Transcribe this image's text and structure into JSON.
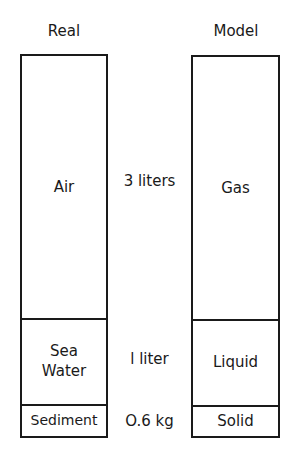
{
  "columns": {
    "real": {
      "title": "Real",
      "layers": [
        "Air",
        "Sea\nWater",
        "Sediment"
      ]
    },
    "model": {
      "title": "Model",
      "layers": [
        "Gas",
        "Liquid",
        "Solid"
      ]
    }
  },
  "quantities": [
    "3 liters",
    "l liter",
    "O.6 kg"
  ]
}
